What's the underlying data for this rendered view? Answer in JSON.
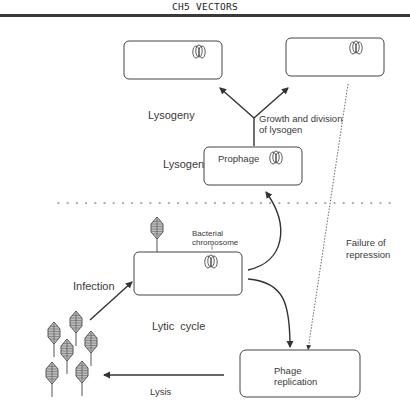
{
  "header": {
    "title": "CH5   VECTORS"
  },
  "labels": {
    "lysogeny": "Lysogeny",
    "growth_division": "Growth and division",
    "of_lysogen": "of lysogen",
    "lysogen": "Lysogen",
    "prophage": "Prophage",
    "bacterial": "Bacterial",
    "chromosome": "chromosome",
    "failure_of": "Failure of",
    "repression": "repression",
    "infection": "Infection",
    "lytic_cycle": "Lytic  cycle",
    "phage": "Phage",
    "replication": "replication",
    "lysis": "Lysis"
  },
  "colors": {
    "line": "#333333",
    "box_stroke": "#444444",
    "text": "#3a3a3a",
    "rule": "#3a3a3a"
  }
}
